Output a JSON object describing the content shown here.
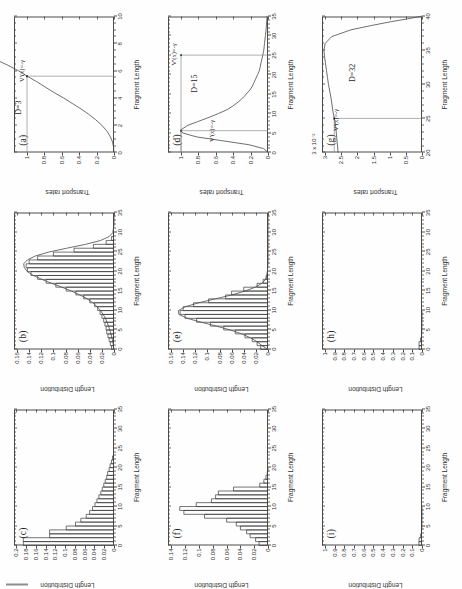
{
  "figure": {
    "rotation_note": "page scanned sideways; panels read bottom-to-top",
    "grid": "3x3",
    "axis_titles": {
      "length_distribution": "Length Distribution",
      "fragment_length": "Fragment Length",
      "transport_rates": "Transport rates"
    }
  },
  "chart_data": [
    {
      "id": "a",
      "type": "line",
      "title": "(a)",
      "xlabel": "Fragment Length",
      "ylabel": "Transport rates",
      "xlim": [
        0,
        10
      ],
      "ylim": [
        0,
        1.15
      ],
      "xticks": [
        0,
        2,
        4,
        6,
        8,
        10
      ],
      "yticks": [
        0,
        0.2,
        0.4,
        0.6,
        0.8,
        1
      ],
      "annotations": [
        "D=3",
        "V'(x)=-γ"
      ],
      "marker_x": 5.6,
      "marker_y": 1.0,
      "x": [
        0,
        0.4,
        0.8,
        1.2,
        1.6,
        2.0,
        2.4,
        2.8,
        3.2,
        3.6,
        4.0,
        4.4,
        4.8,
        5.2,
        5.6,
        6.0,
        6.4,
        7.0,
        7.6,
        8.2,
        8.8,
        9.4,
        10.0
      ],
      "y": [
        0.0,
        0.005,
        0.018,
        0.045,
        0.085,
        0.14,
        0.21,
        0.29,
        0.38,
        0.48,
        0.58,
        0.69,
        0.79,
        0.89,
        1.0,
        1.1,
        1.22,
        1.42,
        1.63,
        1.86,
        2.1,
        2.36,
        2.62
      ],
      "grid": false
    },
    {
      "id": "b",
      "type": "bar",
      "title": "(b)",
      "xlabel": "Fragment Length",
      "ylabel": "Length Distribution",
      "xlim": [
        0,
        35
      ],
      "ylim": [
        0,
        0.165
      ],
      "xticks": [
        0,
        5,
        10,
        15,
        20,
        25,
        30,
        35
      ],
      "yticks": [
        0,
        0.02,
        0.04,
        0.06,
        0.08,
        0.1,
        0.12,
        0.14,
        0.16
      ],
      "bin_width": 1,
      "categories": [
        1,
        2,
        3,
        4,
        5,
        6,
        7,
        8,
        9,
        10,
        11,
        12,
        13,
        14,
        15,
        16,
        17,
        18,
        19,
        20,
        21,
        22,
        23,
        24,
        25,
        26,
        27,
        28,
        29,
        30
      ],
      "values": [
        0.004,
        0.006,
        0.008,
        0.01,
        0.012,
        0.013,
        0.015,
        0.017,
        0.02,
        0.023,
        0.027,
        0.032,
        0.04,
        0.05,
        0.063,
        0.079,
        0.096,
        0.112,
        0.126,
        0.137,
        0.143,
        0.145,
        0.14,
        0.126,
        0.1,
        0.066,
        0.034,
        0.013,
        0.004,
        0.001
      ],
      "overlay_curve": {
        "name": "analytic",
        "x": [
          0,
          2,
          4,
          6,
          8,
          10,
          11,
          12,
          13,
          14,
          15,
          16,
          17,
          18,
          19,
          20,
          21,
          22,
          23,
          24,
          25,
          26,
          27,
          28,
          29,
          30,
          32,
          35
        ],
        "y": [
          0.0,
          0.002,
          0.005,
          0.009,
          0.014,
          0.022,
          0.028,
          0.035,
          0.044,
          0.056,
          0.07,
          0.086,
          0.103,
          0.119,
          0.133,
          0.143,
          0.148,
          0.149,
          0.143,
          0.13,
          0.108,
          0.078,
          0.047,
          0.022,
          0.008,
          0.002,
          0.0,
          0.0
        ]
      },
      "grid": false
    },
    {
      "id": "c",
      "type": "bar",
      "title": "(c)",
      "xlabel": "Fragment Length",
      "ylabel": "Length Distribution",
      "xlim": [
        0,
        35
      ],
      "ylim": [
        0,
        0.205
      ],
      "xticks": [
        0,
        5,
        10,
        15,
        20,
        25,
        30,
        35
      ],
      "yticks": [
        0,
        0.02,
        0.04,
        0.06,
        0.08,
        0.1,
        0.12,
        0.14,
        0.16,
        0.18,
        0.2
      ],
      "bin_width": 1,
      "categories": [
        1,
        2,
        3,
        4,
        5,
        6,
        7,
        8,
        9,
        10,
        11,
        12,
        13,
        14,
        15,
        16,
        17,
        18,
        19,
        20,
        21,
        22,
        23
      ],
      "values": [
        0.186,
        0.186,
        0.132,
        0.132,
        0.098,
        0.079,
        0.068,
        0.057,
        0.05,
        0.044,
        0.039,
        0.035,
        0.031,
        0.027,
        0.024,
        0.021,
        0.018,
        0.015,
        0.013,
        0.01,
        0.008,
        0.005,
        0.003
      ],
      "grid": false
    },
    {
      "id": "d",
      "type": "line",
      "title": "(d)",
      "xlabel": "Fragment Length",
      "ylabel": "Transport rates",
      "xlim": [
        0,
        35
      ],
      "ylim": [
        0,
        1.15
      ],
      "xticks": [
        0,
        5,
        10,
        15,
        20,
        25,
        30,
        35
      ],
      "yticks": [
        0,
        0.2,
        0.4,
        0.6,
        0.8,
        1
      ],
      "annotations": [
        "D=15",
        "V'(x)=-γ",
        "V'(x)=-γ"
      ],
      "markers": [
        {
          "x": 5.6,
          "y": 1.0
        },
        {
          "x": 25.0,
          "y": 1.0
        }
      ],
      "x": [
        0,
        1,
        2,
        3,
        4,
        5,
        5.6,
        6,
        7,
        8,
        9,
        10,
        11,
        12,
        13,
        14,
        15,
        16,
        17,
        18,
        19,
        20,
        21,
        22,
        23,
        24,
        25,
        26,
        28,
        30,
        32,
        35
      ],
      "y": [
        0.0,
        0.05,
        0.22,
        0.52,
        0.82,
        0.98,
        1.0,
        0.99,
        0.92,
        0.8,
        0.68,
        0.57,
        0.47,
        0.4,
        0.34,
        0.29,
        0.25,
        0.21,
        0.18,
        0.16,
        0.14,
        0.12,
        0.1,
        0.09,
        0.08,
        0.07,
        0.06,
        0.05,
        0.04,
        0.03,
        0.02,
        0.01
      ],
      "grid": false
    },
    {
      "id": "e",
      "type": "bar",
      "title": "(e)",
      "xlabel": "Fragment Length",
      "ylabel": "Length Distribution",
      "xlim": [
        0,
        35
      ],
      "ylim": [
        0,
        0.165
      ],
      "xticks": [
        0,
        5,
        10,
        15,
        20,
        25,
        30,
        35
      ],
      "yticks": [
        0,
        0.02,
        0.04,
        0.06,
        0.08,
        0.1,
        0.12,
        0.14,
        0.16
      ],
      "bin_width": 1,
      "categories": [
        1,
        2,
        3,
        4,
        5,
        6,
        7,
        8,
        9,
        10,
        11,
        12,
        13,
        14,
        15,
        16,
        17,
        18,
        19,
        20
      ],
      "values": [
        0.012,
        0.018,
        0.026,
        0.038,
        0.054,
        0.073,
        0.095,
        0.118,
        0.137,
        0.145,
        0.14,
        0.123,
        0.098,
        0.07,
        0.06,
        0.04,
        0.018,
        0.008,
        0.003,
        0.001
      ],
      "overlay_curve": {
        "name": "analytic",
        "x": [
          0,
          1,
          2,
          3,
          4,
          5,
          6,
          7,
          8,
          9,
          10,
          11,
          12,
          13,
          14,
          15,
          16,
          17,
          18,
          19,
          20,
          22,
          25,
          30,
          35
        ],
        "y": [
          0.0,
          0.01,
          0.018,
          0.029,
          0.043,
          0.062,
          0.085,
          0.11,
          0.133,
          0.147,
          0.148,
          0.136,
          0.114,
          0.087,
          0.06,
          0.038,
          0.021,
          0.01,
          0.004,
          0.002,
          0.001,
          0.0,
          0.0,
          0.0,
          0.0
        ]
      },
      "grid": false
    },
    {
      "id": "f",
      "type": "bar",
      "title": "(f)",
      "xlabel": "Fragment Length",
      "ylabel": "Length Distribution",
      "xlim": [
        0,
        35
      ],
      "ylim": [
        0,
        0.145
      ],
      "xticks": [
        0,
        5,
        10,
        15,
        20,
        25,
        30,
        35
      ],
      "yticks": [
        0,
        0.02,
        0.04,
        0.06,
        0.08,
        0.1,
        0.12,
        0.14
      ],
      "bin_width": 1,
      "categories": [
        1,
        2,
        3,
        4,
        5,
        6,
        7,
        8,
        9,
        10,
        11,
        12,
        13,
        14,
        15,
        16,
        17,
        18,
        19,
        20
      ],
      "values": [
        0.013,
        0.018,
        0.026,
        0.031,
        0.04,
        0.046,
        0.06,
        0.092,
        0.122,
        0.128,
        0.104,
        0.082,
        0.076,
        0.072,
        0.05,
        0.012,
        0.006,
        0.003,
        0.001,
        0.0
      ],
      "grid": false
    },
    {
      "id": "g",
      "type": "line",
      "title": "(g)",
      "xlabel": "Fragment Length",
      "ylabel": "Transport rates",
      "y_exponent": "3 x 10⁻²",
      "xlim": [
        20,
        40
      ],
      "ylim": [
        0,
        3.1
      ],
      "xticks": [
        20,
        25,
        30,
        35,
        40
      ],
      "yticks": [
        0,
        0.5,
        1,
        1.5,
        2,
        2.5,
        3
      ],
      "annotations": [
        "D=32",
        "V'(x)=-γ"
      ],
      "marker_x": 25.0,
      "marker_y": 2.72,
      "x": [
        20,
        22,
        24,
        25,
        26,
        28,
        30,
        31,
        32,
        33,
        34,
        35,
        36,
        37,
        38,
        38.6,
        39.2,
        39.6,
        39.9,
        40
      ],
      "y": [
        2.6,
        2.64,
        2.68,
        2.72,
        2.76,
        2.82,
        2.9,
        2.93,
        2.96,
        2.99,
        3.02,
        3.04,
        3.0,
        2.8,
        2.2,
        1.6,
        0.95,
        0.45,
        0.12,
        0.0
      ],
      "grid": false
    },
    {
      "id": "h",
      "type": "bar",
      "title": "(h)",
      "xlabel": "Fragment Length",
      "ylabel": "Length Distribution",
      "xlim": [
        0,
        35
      ],
      "ylim": [
        0,
        1.03
      ],
      "xticks": [
        0,
        5,
        10,
        15,
        20,
        25,
        30,
        35
      ],
      "yticks": [
        0,
        0.1,
        0.2,
        0.3,
        0.4,
        0.5,
        0.6,
        0.7,
        0.8,
        0.9,
        1
      ],
      "bin_width": 1,
      "categories": [
        1,
        2,
        3,
        4,
        5,
        6,
        7,
        8,
        9,
        10
      ],
      "values": [
        0.03,
        0.03,
        0.015,
        0.005,
        0.002,
        0.001,
        0.001,
        0.0,
        0.0,
        0.0
      ],
      "grid": false
    },
    {
      "id": "i",
      "type": "bar",
      "title": "(i)",
      "xlabel": "Fragment Length",
      "ylabel": "Length Distribution",
      "xlim": [
        0,
        35
      ],
      "ylim": [
        0,
        1.03
      ],
      "xticks": [
        0,
        5,
        10,
        15,
        20,
        25,
        30,
        35
      ],
      "yticks": [
        0,
        0.1,
        0.2,
        0.3,
        0.4,
        0.5,
        0.6,
        0.7,
        0.8,
        0.9,
        1
      ],
      "bin_width": 1,
      "categories": [
        1,
        2,
        3,
        4,
        5,
        6,
        7,
        8,
        9,
        10
      ],
      "values": [
        0.032,
        0.03,
        0.014,
        0.005,
        0.002,
        0.001,
        0.001,
        0.0,
        0.0,
        0.0
      ],
      "grid": false
    }
  ]
}
